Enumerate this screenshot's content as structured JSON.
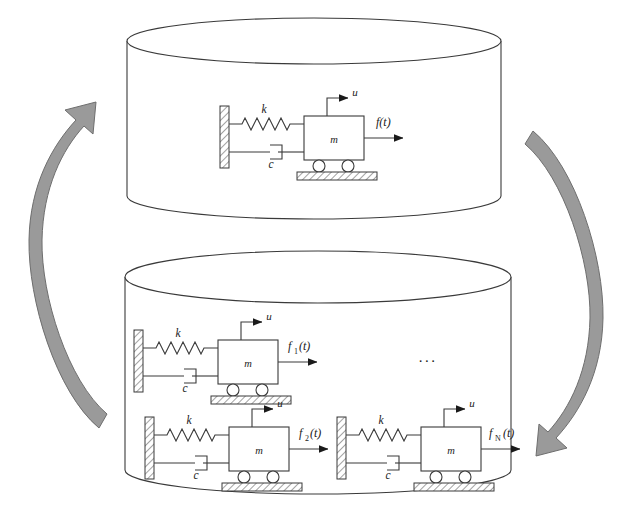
{
  "figure": {
    "title": "",
    "background_color": "#ffffff",
    "line_color": "#3a3a3a",
    "arrow_fill": "#9a9a9a",
    "arrow_stroke": "#6e6e6e",
    "hatch_color": "#555555"
  },
  "cylinders": [
    {
      "id": "top-cylinder",
      "name": "single-system-container",
      "label": ""
    },
    {
      "id": "bottom-cylinder",
      "name": "multi-system-container",
      "label": ""
    }
  ],
  "flow_arrows": [
    {
      "id": "left-arrow",
      "name": "upward-curved-arrow",
      "direction": "up",
      "label": ""
    },
    {
      "id": "right-arrow",
      "name": "downward-curved-arrow",
      "direction": "down",
      "label": ""
    }
  ],
  "systems": [
    {
      "id": "sys-top",
      "container": "top-cylinder",
      "spring_label": "k",
      "damper_label": "c",
      "mass_label": "m",
      "displacement_label": "u",
      "force_label": "f(t)",
      "force_sub": ""
    },
    {
      "id": "sys-1",
      "container": "bottom-cylinder",
      "spring_label": "k",
      "damper_label": "c",
      "mass_label": "m",
      "displacement_label": "u",
      "force_label": "f",
      "force_sub": "1",
      "force_tail": "(t)"
    },
    {
      "id": "sys-2",
      "container": "bottom-cylinder",
      "spring_label": "k",
      "damper_label": "c",
      "mass_label": "m",
      "displacement_label": "u",
      "force_label": "f",
      "force_sub": "2",
      "force_tail": "(t)"
    },
    {
      "id": "sys-N",
      "container": "bottom-cylinder",
      "spring_label": "k",
      "damper_label": "c",
      "mass_label": "m",
      "displacement_label": "u",
      "force_label": "f",
      "force_sub": "N",
      "force_tail": "(t)"
    }
  ],
  "ellipsis": {
    "name": "systems-ellipsis",
    "text": "..."
  }
}
